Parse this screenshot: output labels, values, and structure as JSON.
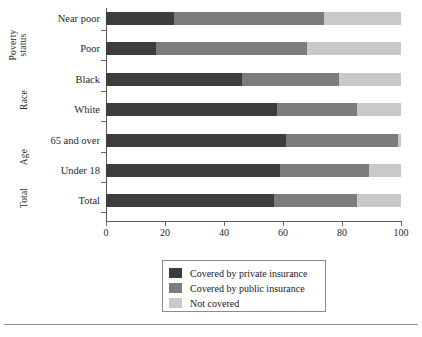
{
  "chart_data": {
    "type": "bar",
    "orientation": "horizontal",
    "stacked": true,
    "title": "",
    "xlabel": "",
    "ylabel": "",
    "xlim": [
      0,
      100
    ],
    "xticks": [
      0,
      20,
      40,
      60,
      80,
      100
    ],
    "grid": false,
    "legend_position": "bottom-center",
    "categories": [
      "Near poor",
      "Poor",
      "Black",
      "White",
      "65 and over",
      "Under 18",
      "Total"
    ],
    "group_labels": [
      "Poverty status",
      "Race",
      "Age",
      "Total"
    ],
    "series": [
      {
        "name": "Covered by private insurance",
        "color": "#3d3d3d",
        "values": [
          23,
          17,
          46,
          58,
          61,
          59,
          57
        ]
      },
      {
        "name": "Covered by public insurance",
        "color": "#7c7c7c",
        "values": [
          51,
          51,
          33,
          27,
          38,
          30,
          28
        ]
      },
      {
        "name": "Not covered",
        "color": "#c9c9c9",
        "values": [
          26,
          32,
          21,
          15,
          1,
          11,
          15
        ]
      }
    ]
  },
  "axis": {
    "x_tick_labels": [
      "0",
      "20",
      "40",
      "60",
      "80",
      "100"
    ]
  },
  "groups": {
    "poverty": {
      "line1": "Poverty",
      "line2": "status"
    },
    "race": "Race",
    "age": "Age",
    "total": "Total"
  },
  "categories": [
    {
      "label": "Near poor"
    },
    {
      "label": "Poor"
    },
    {
      "label": "Black"
    },
    {
      "label": "White"
    },
    {
      "label": "65 and over"
    },
    {
      "label": "Under 18"
    },
    {
      "label": "Total"
    }
  ],
  "legend": {
    "items": [
      {
        "label": "Covered by private insurance",
        "color": "#3d3d3d"
      },
      {
        "label": "Covered by public insurance",
        "color": "#7c7c7c"
      },
      {
        "label": "Not covered",
        "color": "#c9c9c9"
      }
    ]
  }
}
